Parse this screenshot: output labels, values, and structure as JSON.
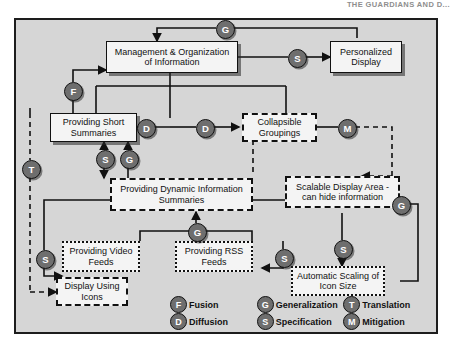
{
  "page_header": "THE GUARDIANS AND D...",
  "diagram": {
    "nodes": [
      {
        "id": "mgmt",
        "label": "Management & Organization of Information",
        "style": "solid"
      },
      {
        "id": "pers",
        "label": "Personalized Display",
        "style": "solid"
      },
      {
        "id": "short",
        "label": "Providing Short Summaries",
        "style": "solid"
      },
      {
        "id": "collap",
        "label": "Collapsible Groupings",
        "style": "dashed"
      },
      {
        "id": "dyn",
        "label": "Providing Dynamic Information Summaries",
        "style": "dashed"
      },
      {
        "id": "scal",
        "label": "Scalable Display Area - can hide information",
        "style": "dashed"
      },
      {
        "id": "video",
        "label": "Providing Video Feeds",
        "style": "dotted"
      },
      {
        "id": "rss",
        "label": "Providing RSS Feeds",
        "style": "dotted"
      },
      {
        "id": "auto",
        "label": "Automatic Scaling of Icon Size",
        "style": "dotted"
      },
      {
        "id": "icons",
        "label": "Display Using Icons",
        "style": "dashed"
      }
    ],
    "operators": [
      {
        "id": "op-g-top",
        "code": "G"
      },
      {
        "id": "op-s-pers",
        "code": "S"
      },
      {
        "id": "op-f-left",
        "code": "F"
      },
      {
        "id": "op-d-left",
        "code": "D"
      },
      {
        "id": "op-d-right",
        "code": "D"
      },
      {
        "id": "op-m-right",
        "code": "M"
      },
      {
        "id": "op-s-dyn",
        "code": "S"
      },
      {
        "id": "op-g-short",
        "code": "G"
      },
      {
        "id": "op-t-left",
        "code": "T"
      },
      {
        "id": "op-s-video",
        "code": "S"
      },
      {
        "id": "op-g-feeds",
        "code": "G"
      },
      {
        "id": "op-s-rss",
        "code": "S"
      },
      {
        "id": "op-s-auto",
        "code": "S"
      },
      {
        "id": "op-g-scale",
        "code": "G"
      }
    ]
  },
  "legend": {
    "items": [
      {
        "code": "F",
        "label": "Fusion"
      },
      {
        "code": "G",
        "label": "Generalization"
      },
      {
        "code": "T",
        "label": "Translation"
      },
      {
        "code": "D",
        "label": "Diffusion"
      },
      {
        "code": "S",
        "label": "Specification"
      },
      {
        "code": "M",
        "label": "Mitigation"
      }
    ]
  },
  "colors": {
    "frame_fill": "#d6d6d6",
    "node_fill": "#f4f4f4",
    "operator_fill": "#6e6e6e",
    "stroke": "#111111"
  }
}
